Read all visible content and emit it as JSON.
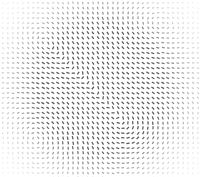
{
  "figure": {
    "title": "",
    "width": 201,
    "height": 177,
    "background_color": "#ffffff",
    "caption": ""
  },
  "chart_data": {
    "type": "scatter",
    "plot_kind": "vector-orientation-field",
    "title": "",
    "subtitle": "",
    "xlabel": "",
    "ylabel": "",
    "xlim": [
      0,
      201
    ],
    "ylim": [
      0,
      177
    ],
    "grid": false,
    "legend": null,
    "annotations": [],
    "tick_labels_x": [],
    "tick_labels_y": [],
    "glyph": {
      "shape": "dash",
      "color": "#4a4a4a",
      "length_px": 3.2,
      "thickness_px": 1.25,
      "linecap": "butt",
      "max_opacity": 0.92,
      "min_opacity": 0.06
    },
    "sampling": {
      "grid_spacing_px": 5.0,
      "origin_x_px": 3.0,
      "origin_y_px": 3.0,
      "columns": 40,
      "rows": 36,
      "total_glyphs": 1440,
      "jitter_px": 0.35
    },
    "field_model": {
      "description": "Sum of rotational vortex sources; dash angle equals local field direction (mod 180 deg)",
      "base_angle_deg": 90,
      "vignette": {
        "type": "radial",
        "center_x_px": 100.5,
        "center_y_px": 88.5,
        "inner_radius_px": 62,
        "outer_radius_px": 122,
        "corner_falloff": 0.85
      },
      "sources": [
        {
          "name": "vortex-upper-left",
          "x_px": 52,
          "y_px": 44,
          "strength": 1.0,
          "sigma_px": 46,
          "sense": 1
        },
        {
          "name": "vortex-upper-right",
          "x_px": 150,
          "y_px": 40,
          "strength": 0.85,
          "sigma_px": 42,
          "sense": -1
        },
        {
          "name": "vortex-center",
          "x_px": 100,
          "y_px": 92,
          "strength": 0.95,
          "sigma_px": 40,
          "sense": 1
        },
        {
          "name": "vortex-lower-left",
          "x_px": 48,
          "y_px": 134,
          "strength": 0.8,
          "sigma_px": 40,
          "sense": -1
        },
        {
          "name": "vortex-lower-right",
          "x_px": 152,
          "y_px": 138,
          "strength": 0.75,
          "sigma_px": 38,
          "sense": 1
        },
        {
          "name": "saddle-left-mid",
          "x_px": 24,
          "y_px": 90,
          "strength": 0.45,
          "sigma_px": 34,
          "sense": -1
        },
        {
          "name": "saddle-right-mid",
          "x_px": 178,
          "y_px": 92,
          "strength": 0.45,
          "sigma_px": 34,
          "sense": 1
        },
        {
          "name": "vortex-top-center",
          "x_px": 102,
          "y_px": 16,
          "strength": 0.55,
          "sigma_px": 32,
          "sense": -1
        },
        {
          "name": "vortex-bottom-center",
          "x_px": 98,
          "y_px": 164,
          "strength": 0.55,
          "sigma_px": 32,
          "sense": 1
        }
      ],
      "noise": {
        "amplitude_deg": 7,
        "spatial_frequency": 0.055,
        "seed": 20240917
      }
    }
  }
}
